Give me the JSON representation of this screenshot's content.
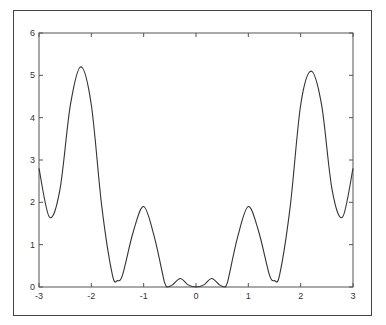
{
  "chart_data": {
    "type": "line",
    "title": "",
    "xlabel": "",
    "ylabel": "",
    "xlim": [
      -3,
      3
    ],
    "ylim": [
      0,
      6
    ],
    "grid": false,
    "legend": null,
    "x_ticks": [
      "-3",
      "-2",
      "-1",
      "0",
      "1",
      "2",
      "3"
    ],
    "y_ticks": [
      "0",
      "1",
      "2",
      "3",
      "4",
      "5",
      "6"
    ],
    "series": [
      {
        "name": "f(x)",
        "color": "#333333",
        "x": [
          -3.0,
          -2.8,
          -2.6,
          -2.4,
          -2.2,
          -2.0,
          -1.8,
          -1.6,
          -1.5,
          -1.4,
          -1.2,
          -1.0,
          -0.8,
          -0.6,
          -0.55,
          -0.45,
          -0.3,
          -0.15,
          0.0,
          0.15,
          0.3,
          0.45,
          0.55,
          0.6,
          0.8,
          1.0,
          1.2,
          1.4,
          1.5,
          1.6,
          1.8,
          2.0,
          2.2,
          2.4,
          2.6,
          2.8,
          3.0
        ],
        "y": [
          2.8,
          1.65,
          2.3,
          4.3,
          5.2,
          4.3,
          1.9,
          0.3,
          0.15,
          0.3,
          1.3,
          1.9,
          1.2,
          0.1,
          0.0,
          0.05,
          0.2,
          0.05,
          0.0,
          0.05,
          0.2,
          0.05,
          0.0,
          0.1,
          1.2,
          1.9,
          1.3,
          0.3,
          0.15,
          0.3,
          1.9,
          4.3,
          5.1,
          4.3,
          2.3,
          1.65,
          2.8
        ]
      }
    ]
  }
}
